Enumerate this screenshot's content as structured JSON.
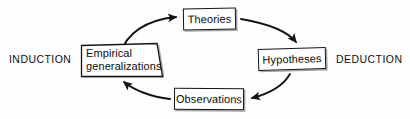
{
  "diagram": {
    "background_color": "#fefefe",
    "line_color": "#141414",
    "nodes": [
      {
        "id": "theories",
        "label": "Theories",
        "position": "top"
      },
      {
        "id": "hypotheses",
        "label": "Hypotheses",
        "position": "right"
      },
      {
        "id": "observations",
        "label": "Observations",
        "position": "bottom"
      },
      {
        "id": "empirical-generalizations",
        "label": "Empirical generalizations",
        "line1": "Empirical",
        "line2": "generalizations",
        "position": "left"
      }
    ],
    "side_labels": {
      "left": "INDUCTION",
      "right": "DEDUCTION"
    },
    "edges": [
      {
        "from": "empirical-generalizations",
        "to": "theories",
        "direction": "clockwise",
        "arrowhead": "right"
      },
      {
        "from": "theories",
        "to": "hypotheses",
        "direction": "clockwise",
        "arrowhead": "down"
      },
      {
        "from": "hypotheses",
        "to": "observations",
        "direction": "clockwise",
        "arrowhead": "left"
      },
      {
        "from": "observations",
        "to": "empirical-generalizations",
        "direction": "clockwise",
        "arrowhead": "up-left"
      }
    ]
  }
}
